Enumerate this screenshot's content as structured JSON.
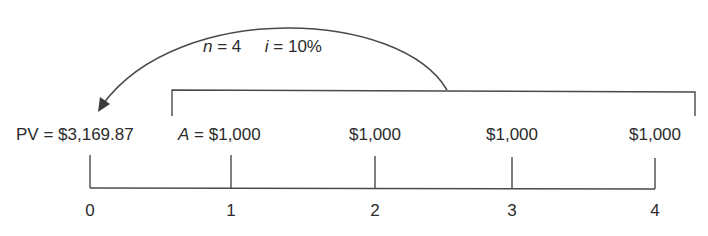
{
  "diagram": {
    "type": "cash-flow-timeline",
    "params": {
      "n_var": "n",
      "n_eq": " = 4",
      "i_var": "i",
      "i_eq": " = 10%"
    },
    "pv_label": "PV = $3,169.87",
    "a_var": "A",
    "a_eq": " = $1,000",
    "payments": [
      "$1,000",
      "$1,000",
      "$1,000"
    ],
    "periods": [
      "0",
      "1",
      "2",
      "3",
      "4"
    ],
    "colors": {
      "line": "#4a4a4a",
      "text": "#2b2b2b"
    }
  }
}
